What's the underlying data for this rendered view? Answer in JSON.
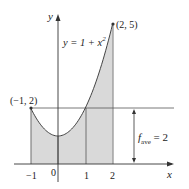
{
  "diagram": {
    "function_label": "y = 1 + x",
    "function_exponent": "2",
    "point_left_label": "(−1, 2)",
    "point_right_label": "(2, 5)",
    "average_label_main": "f",
    "average_label_sub": "ave",
    "average_label_value": " = 2",
    "axis_x_label": "x",
    "axis_y_label": "y",
    "x_ticks": [
      "−1",
      "0",
      "1",
      "2"
    ],
    "colors": {
      "fill": "#d9d9d9",
      "line": "#444444",
      "text": "#222222"
    }
  },
  "chart_data": {
    "type": "area",
    "title": "",
    "function": "y = 1 + x^2",
    "x": [
      -1,
      -0.5,
      0,
      0.5,
      1,
      1.5,
      2
    ],
    "y": [
      2,
      1.25,
      1,
      1.25,
      2,
      3.25,
      5
    ],
    "shaded_interval": [
      -1,
      2
    ],
    "average_value_line": 2,
    "annotations": [
      "(-1, 2)",
      "(2, 5)",
      "y = 1 + x^2",
      "f_ave = 2"
    ],
    "xlabel": "x",
    "ylabel": "y",
    "x_tick_labels": [
      "-1",
      "0",
      "1",
      "2"
    ],
    "xlim": [
      -1.3,
      4.3
    ],
    "ylim": [
      -0.9,
      6
    ],
    "grid": false
  }
}
